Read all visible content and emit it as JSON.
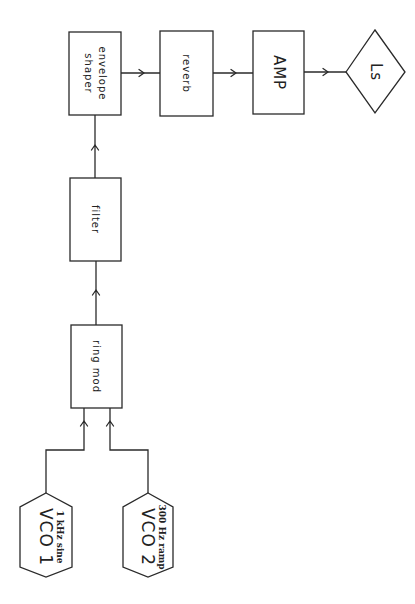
{
  "diagram": {
    "colors": {
      "stroke": "#2a2a2a",
      "background": "#ffffff",
      "text": "#222222"
    },
    "sources": [
      {
        "id": "vco1",
        "label": "VCO 1",
        "sublabel": "1 kHz sine",
        "shape": "hexagon"
      },
      {
        "id": "vco2",
        "label": "VCO 2",
        "sublabel": "300 Hz ramp",
        "shape": "hexagon"
      }
    ],
    "blocks": [
      {
        "id": "ring_mod",
        "label": "ring mod",
        "shape": "rectangle"
      },
      {
        "id": "filter",
        "label": "filter",
        "shape": "rectangle"
      },
      {
        "id": "envelope_shaper",
        "label_line1": "envelope",
        "label_line2": "shaper",
        "shape": "rectangle"
      },
      {
        "id": "reverb",
        "label": "reverb",
        "shape": "rectangle"
      },
      {
        "id": "amp",
        "label": "AMP",
        "shape": "rectangle"
      }
    ],
    "output": {
      "id": "loudspeaker",
      "label": "Ls",
      "shape": "diamond"
    },
    "connections": [
      {
        "from": "vco1",
        "to": "ring_mod"
      },
      {
        "from": "vco2",
        "to": "ring_mod"
      },
      {
        "from": "ring_mod",
        "to": "filter"
      },
      {
        "from": "filter",
        "to": "envelope_shaper"
      },
      {
        "from": "envelope_shaper",
        "to": "reverb"
      },
      {
        "from": "reverb",
        "to": "amp"
      },
      {
        "from": "amp",
        "to": "loudspeaker"
      }
    ]
  }
}
